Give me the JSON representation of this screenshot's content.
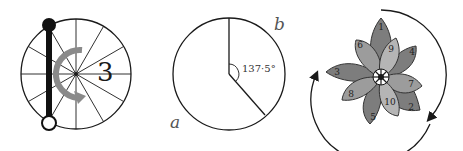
{
  "figures": [
    {
      "id": "spoked-wheel",
      "label": "3",
      "spokes": 12,
      "description": "circle divided into 12 sectors with a black rod chord and grey rotation arrow"
    },
    {
      "id": "divergence-angle",
      "angle_label": "137·5°",
      "arc_labels": {
        "a": "a",
        "b": "b"
      }
    },
    {
      "id": "petal-rosette",
      "petal_numbers": [
        "1",
        "2",
        "3",
        "4",
        "5",
        "6",
        "7",
        "8",
        "9",
        "10"
      ]
    }
  ],
  "colors": {
    "stroke": "#1a1a1a",
    "arrow_grey": "#8a8a8a",
    "petal_dark": "#7d7d7d",
    "petal_mid": "#9c9c9c",
    "petal_light": "#b5b5b5"
  }
}
